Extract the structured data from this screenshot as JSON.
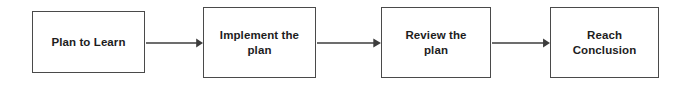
{
  "diagram": {
    "type": "flowchart",
    "orientation": "left-to-right",
    "background_color": "#ffffff",
    "box_border_color": "#4a4a4a",
    "text_color": "#1d1d1d",
    "arrow_color": "#3c3c3c",
    "nodes": [
      {
        "id": "plan-to-learn",
        "label": "Plan to Learn",
        "x": 32,
        "y": 11,
        "width": 113,
        "height": 62
      },
      {
        "id": "implement-the-plan",
        "label": "Implement the\nplan",
        "x": 203,
        "y": 7,
        "width": 113,
        "height": 71
      },
      {
        "id": "review-the-plan",
        "label": "Review the\nplan",
        "x": 381,
        "y": 7,
        "width": 110,
        "height": 71
      },
      {
        "id": "reach-conclusion",
        "label": "Reach\nConclusion",
        "x": 550,
        "y": 7,
        "width": 109,
        "height": 71
      }
    ],
    "connectors": [
      {
        "id": "plan-to-implement",
        "from": "plan-to-learn",
        "to": "implement-the-plan",
        "x": 146,
        "y": 37,
        "length": 57
      },
      {
        "id": "implement-to-review",
        "from": "implement-the-plan",
        "to": "review-the-plan",
        "x": 317,
        "y": 37,
        "length": 64
      },
      {
        "id": "review-to-conclusion",
        "from": "review-the-plan",
        "to": "reach-conclusion",
        "x": 492,
        "y": 37,
        "length": 58
      }
    ]
  }
}
